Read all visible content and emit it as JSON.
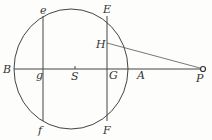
{
  "diagram": {
    "type": "geometry",
    "colors": {
      "stroke": "#444444",
      "background": "#fdfdfc",
      "label": "#333333"
    },
    "circle": {
      "cx": 71,
      "cy": 69,
      "rx": 57,
      "ry": 60
    },
    "points": {
      "B": {
        "label": "B",
        "x": 14,
        "y": 69,
        "lx": 3,
        "ly": 73
      },
      "g": {
        "label": "g",
        "x": 43,
        "y": 69,
        "lx": 36,
        "ly": 79
      },
      "S": {
        "label": "S",
        "x": 75,
        "y": 69,
        "lx": 71,
        "ly": 79
      },
      "G": {
        "label": "G",
        "x": 107,
        "y": 69,
        "lx": 108,
        "ly": 79
      },
      "A": {
        "label": "A",
        "x": 128,
        "y": 69,
        "lx": 138,
        "ly": 79
      },
      "P": {
        "label": "P",
        "x": 203,
        "y": 69,
        "lx": 196,
        "ly": 81
      },
      "e": {
        "label": "e",
        "x": 43,
        "y": 17,
        "lx": 40,
        "ly": 14
      },
      "f": {
        "label": "f",
        "x": 43,
        "y": 120,
        "lx": 38,
        "ly": 133
      },
      "E": {
        "label": "E",
        "x": 107,
        "y": 17,
        "lx": 103,
        "ly": 13
      },
      "F": {
        "label": "F",
        "x": 107,
        "y": 120,
        "lx": 103,
        "ly": 133
      },
      "H": {
        "label": "H",
        "x": 107,
        "y": 43,
        "lx": 96,
        "ly": 48
      }
    },
    "segments": [
      [
        "B",
        "P"
      ],
      [
        "e",
        "f"
      ],
      [
        "E",
        "F"
      ],
      [
        "H",
        "P"
      ]
    ]
  }
}
